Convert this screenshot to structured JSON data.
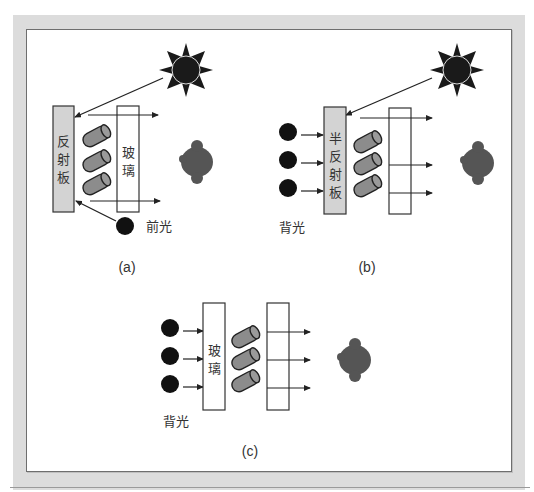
{
  "figure": {
    "colors": {
      "frame": "#dcdcdc",
      "panel_border": "#6e6e6e",
      "reflector_fill": "#d3d3d3",
      "glass_fill": "#ffffff",
      "cylinder_fill": "#8c8c8c",
      "sun_fill": "#1a1a1a",
      "light_source": "#111111",
      "viewer": "#555555",
      "line": "#222222"
    },
    "panel_a": {
      "caption": "(a)",
      "reflector_label": [
        "反",
        "射",
        "板"
      ],
      "glass_label": [
        "玻",
        "璃"
      ],
      "light_label": "前光"
    },
    "panel_b": {
      "caption": "(b)",
      "reflector_label": [
        "半",
        "反",
        "射",
        "板"
      ],
      "light_label": "背光"
    },
    "panel_c": {
      "caption": "(c)",
      "glass_label": [
        "玻",
        "璃"
      ],
      "light_label": "背光"
    }
  }
}
